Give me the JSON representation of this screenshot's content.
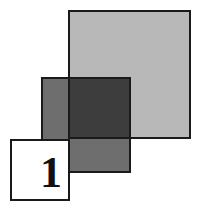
{
  "figure": {
    "label_number": "1",
    "colors": {
      "large_square": "#b8b8b8",
      "medium_square": "#6e6e6e",
      "overlap": "#3d3d3d",
      "label_box": "#ffffff",
      "border": "#1a1a1a"
    }
  }
}
